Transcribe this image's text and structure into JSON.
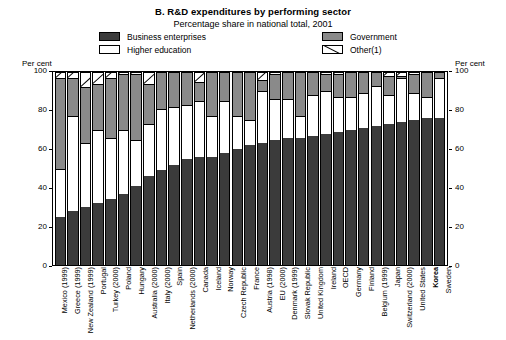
{
  "titles": {
    "main": "B.  R&D expenditures by performing sector",
    "sub": "Percentage share in national total, 2001"
  },
  "legend": {
    "left": [
      {
        "key": "business",
        "label": "Business enterprises",
        "color": "#3b3b3b"
      },
      {
        "key": "higher",
        "label": "Higher education",
        "color": "#ffffff"
      }
    ],
    "right": [
      {
        "key": "government",
        "label": "Government",
        "color": "#8a8a8a"
      },
      {
        "key": "other",
        "label": "Other(1)",
        "color": "#ffffff"
      }
    ]
  },
  "axes": {
    "left_title": "Per cent",
    "right_title": "Per cent",
    "ticks": [
      0,
      20,
      40,
      60,
      80,
      100
    ]
  },
  "chart_data": {
    "type": "bar",
    "stacked": true,
    "title": "B.  R&D expenditures by performing sector",
    "subtitle": "Percentage share in national total, 2001",
    "xlabel": "",
    "ylabel": "Per cent",
    "ylim": [
      0,
      100
    ],
    "yticks": [
      0,
      20,
      40,
      60,
      80,
      100
    ],
    "grid": false,
    "legend_position": "top",
    "note": "(1) Other",
    "categories": [
      "Mexico (1999)",
      "Greece (1999)",
      "New Zealand (1999)",
      "Portugal",
      "Turkey (2000)",
      "Poland",
      "Hungary",
      "Australia (2000)",
      "Italy (2000)",
      "Spain",
      "Netherlands (2000)",
      "Canada",
      "Iceland",
      "Norway",
      "Czech Republic",
      "France",
      "Austria (1998)",
      "EU (2000)",
      "Denmark (1999)",
      "Slovak Republic",
      "United Kingdom",
      "Ireland",
      "OECD",
      "Germany",
      "Finland",
      "Belgium (1999)",
      "Japan",
      "Switzerland (2000)",
      "United States",
      "Korea",
      "Sweden"
    ],
    "bold_categories": [
      "Korea"
    ],
    "series": [
      {
        "name": "Business enterprises",
        "color": "#3b3b3b",
        "values": [
          25,
          28,
          30,
          32,
          34,
          37,
          41,
          46,
          49,
          52,
          55,
          56,
          56,
          58,
          60,
          62,
          63,
          65,
          66,
          66,
          67,
          68,
          69,
          70,
          71,
          72,
          73,
          74,
          75,
          76,
          76
        ]
      },
      {
        "name": "Higher education",
        "color": "#ffffff",
        "values": [
          25,
          49,
          33,
          38,
          32,
          33,
          24,
          27,
          32,
          30,
          28,
          29,
          21,
          27,
          17,
          13,
          27,
          21,
          20,
          11,
          21,
          22,
          18,
          17,
          18,
          21,
          15,
          23,
          14,
          11,
          21
        ]
      },
      {
        "name": "Government",
        "color": "#8a8a8a",
        "values": [
          47,
          20,
          29,
          24,
          31,
          29,
          34,
          21,
          19,
          18,
          17,
          10,
          23,
          15,
          23,
          25,
          6,
          13,
          14,
          23,
          12,
          9,
          12,
          13,
          11,
          7,
          10,
          1,
          10,
          13,
          3
        ]
      },
      {
        "name": "Other(1)",
        "color": "#ffffff",
        "values": [
          3,
          3,
          8,
          6,
          3,
          1,
          1,
          6,
          0,
          0,
          0,
          5,
          0,
          0,
          0,
          0,
          4,
          1,
          0,
          0,
          0,
          1,
          1,
          0,
          0,
          0,
          2,
          2,
          1,
          0,
          0
        ]
      }
    ]
  }
}
